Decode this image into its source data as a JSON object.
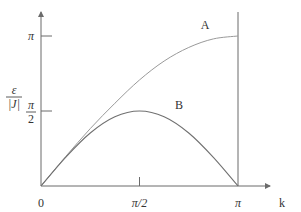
{
  "chart_data": {
    "type": "line",
    "title": "",
    "xlabel": "k",
    "ylabel_numerator": "ε",
    "ylabel_denominator": "|J|",
    "xlim": [
      0,
      3.1416
    ],
    "ylim": [
      0,
      3.6
    ],
    "x_ticks": [
      {
        "value": 0,
        "label": "0"
      },
      {
        "value": 1.5708,
        "label": "π/2"
      },
      {
        "value": 3.1416,
        "label": "π"
      }
    ],
    "y_ticks": [
      {
        "value": 1.5708,
        "label_num": "π",
        "label_den": "2"
      },
      {
        "value": 3.1416,
        "label": "π"
      }
    ],
    "grid": false,
    "series": [
      {
        "name": "A",
        "label": "A",
        "x": [
          0,
          0.3927,
          0.7854,
          1.1781,
          1.5708,
          1.9635,
          2.3562,
          2.7489,
          3.1416
        ],
        "values": [
          0,
          0.616,
          1.202,
          1.733,
          2.221,
          2.617,
          2.902,
          3.081,
          3.1416
        ]
      },
      {
        "name": "B",
        "label": "B",
        "x": [
          0,
          0.3927,
          0.7854,
          1.1781,
          1.5708,
          1.9635,
          2.3562,
          2.7489,
          3.1416
        ],
        "values": [
          0,
          0.601,
          1.111,
          1.451,
          1.5708,
          1.451,
          1.111,
          0.601,
          0
        ]
      }
    ],
    "annotations": [
      "vertical line at k = π"
    ]
  }
}
